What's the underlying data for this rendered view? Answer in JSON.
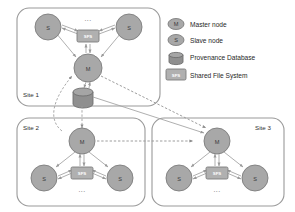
{
  "figure": {
    "background_color": "#ffffff"
  },
  "legend": {
    "items": [
      {
        "icon": "master-node-icon",
        "symbol": "M",
        "label": "Master node"
      },
      {
        "icon": "slave-node-icon",
        "symbol": "S",
        "label": "Slave node"
      },
      {
        "icon": "database-icon",
        "symbol": "",
        "label": "Provenance Database"
      },
      {
        "icon": "shared-file-system-icon",
        "symbol": "SFS",
        "label": "Shared File System"
      }
    ]
  },
  "sites": [
    {
      "id": "site-1",
      "label": "Site 1",
      "master": {
        "symbol": "M",
        "name": "master-node"
      },
      "slaves": [
        {
          "symbol": "S",
          "name": "slave-node"
        },
        {
          "symbol": "S",
          "name": "slave-node"
        }
      ],
      "sfs": {
        "symbol": "SFS",
        "name": "shared-file-system"
      },
      "ellipsis": "..."
    },
    {
      "id": "site-2",
      "label": "Site 2",
      "master": {
        "symbol": "M",
        "name": "master-node"
      },
      "slaves": [
        {
          "symbol": "S",
          "name": "slave-node"
        },
        {
          "symbol": "S",
          "name": "slave-node"
        }
      ],
      "sfs": {
        "symbol": "SFS",
        "name": "shared-file-system"
      },
      "ellipsis": "..."
    },
    {
      "id": "site-3",
      "label": "Site 3",
      "master": {
        "symbol": "M",
        "name": "master-node"
      },
      "slaves": [
        {
          "symbol": "S",
          "name": "slave-node"
        },
        {
          "symbol": "S",
          "name": "slave-node"
        }
      ],
      "sfs": {
        "symbol": "SFS",
        "name": "shared-file-system"
      },
      "ellipsis": "..."
    }
  ],
  "database": {
    "name": "provenance-database",
    "label": ""
  },
  "colors": {
    "node_fill": "#a8a8a8",
    "node_stroke": "#7d7d7d",
    "sfs_fill": "#b0b0b0",
    "db_fill": "#8f8f8f",
    "frame_stroke": "#9a9a9a",
    "link": "#a0a0a0",
    "text": "#1f1f1f"
  }
}
